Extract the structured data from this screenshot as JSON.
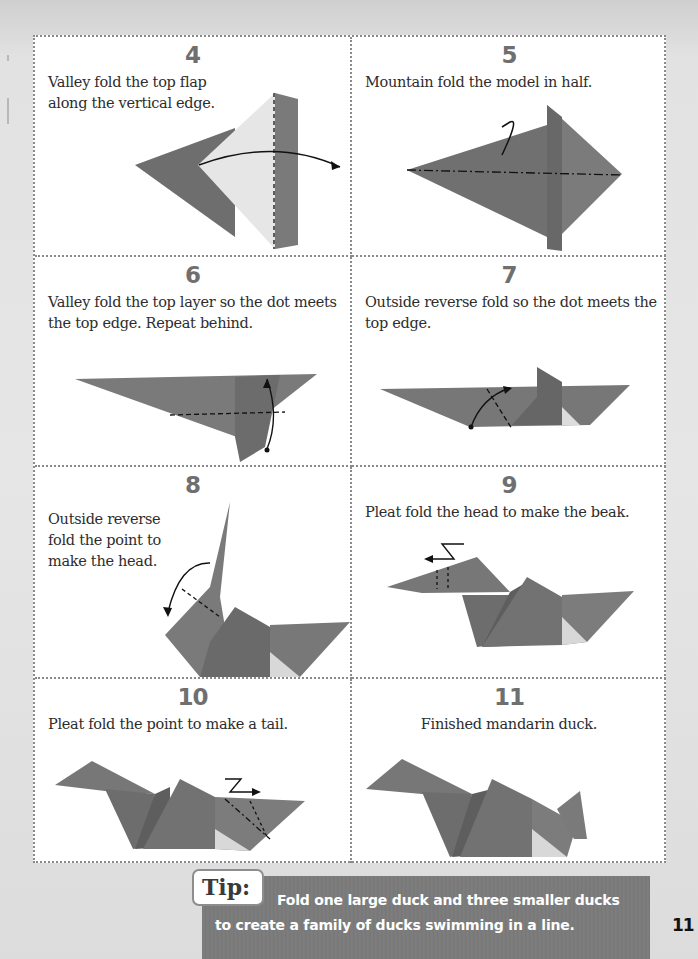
{
  "page": {
    "page_number": "11",
    "colors": {
      "paper_fill": "#7c7c7c",
      "paper_light": "#e4e4e4",
      "paper_dark": "#5e5e5e",
      "step_number": "#6f6f6f",
      "tip_bar": "#7a7a7a",
      "border": "#8a8a8a"
    }
  },
  "steps": [
    {
      "number": "4",
      "text_lines": [
        "Valley fold the top flap",
        "along the vertical edge."
      ],
      "illustration": "valley-fold-top-flap"
    },
    {
      "number": "5",
      "text_lines": [
        "Mountain fold the model in half."
      ],
      "illustration": "mountain-fold-half"
    },
    {
      "number": "6",
      "text_lines": [
        "Valley fold the top layer so the dot meets",
        "the top edge. Repeat behind."
      ],
      "illustration": "valley-fold-dot"
    },
    {
      "number": "7",
      "text_lines": [
        "Outside reverse fold so the dot meets the",
        "top edge."
      ],
      "illustration": "outside-reverse-fold-dot"
    },
    {
      "number": "8",
      "text_lines": [
        "Outside reverse",
        "fold the point to",
        "make the head."
      ],
      "illustration": "outside-reverse-fold-head"
    },
    {
      "number": "9",
      "text_lines": [
        "Pleat fold the head to make the beak."
      ],
      "illustration": "pleat-fold-beak"
    },
    {
      "number": "10",
      "text_lines": [
        "Pleat fold the point to make a tail."
      ],
      "illustration": "pleat-fold-tail"
    },
    {
      "number": "11",
      "text_lines": [
        "Finished mandarin duck."
      ],
      "illustration": "finished-duck"
    }
  ],
  "tip": {
    "label": "Tip:",
    "line1": "Fold one large duck and three smaller ducks",
    "line2": "to create a family of ducks swimming in a line."
  }
}
